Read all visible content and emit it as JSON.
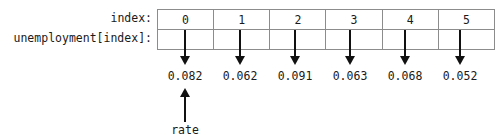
{
  "diagram": {
    "labels": {
      "index_row": "index:",
      "array_row": "unemployment[index]:"
    },
    "indices": [
      "0",
      "1",
      "2",
      "3",
      "4",
      "5"
    ],
    "values": [
      "0.082",
      "0.062",
      "0.091",
      "0.063",
      "0.068",
      "0.052"
    ],
    "annotation": {
      "text": "rate",
      "points_to_index": "0"
    },
    "colors": {
      "border": "#8c8c8c",
      "text": "#1a1a1a",
      "arrow": "#111111",
      "background": "#ffffff"
    }
  }
}
